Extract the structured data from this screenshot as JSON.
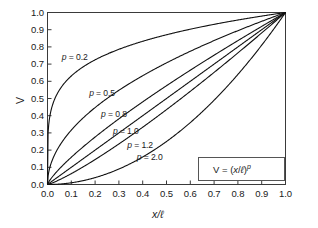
{
  "chart_data": {
    "type": "line",
    "title": "",
    "xlabel": "x/ℓ",
    "ylabel": "V",
    "xlim": [
      0.0,
      1.0
    ],
    "ylim": [
      0.0,
      1.0
    ],
    "grid": false,
    "legend_position": "inline-annotations",
    "equation": "V = (x/ℓ)ᵖ",
    "equation_parts": {
      "lhs": "V",
      "eq": "=",
      "open": "(",
      "num": "x",
      "slash": "/",
      "den": "ℓ",
      "close": ")",
      "exponent": "p"
    },
    "xticks": [
      "0.0",
      "0.1",
      "0.2",
      "0.3",
      "0.4",
      "0.5",
      "0.6",
      "0.7",
      "0.8",
      "0.9",
      "1.0"
    ],
    "xtick_values": [
      0.0,
      0.1,
      0.2,
      0.3,
      0.4,
      0.5,
      0.6,
      0.7,
      0.8,
      0.9,
      1.0
    ],
    "yticks": [
      "0.0",
      "0.1",
      "0.2",
      "0.3",
      "0.4",
      "0.5",
      "0.6",
      "0.7",
      "0.8",
      "0.9",
      "1.0"
    ],
    "ytick_values": [
      0.0,
      0.1,
      0.2,
      0.3,
      0.4,
      0.5,
      0.6,
      0.7,
      0.8,
      0.9,
      1.0
    ],
    "series": [
      {
        "name": "p = 0.2",
        "p": 0.2,
        "label": "p = 0.2",
        "x": [
          0.0,
          0.005,
          0.01,
          0.02,
          0.03,
          0.05,
          0.08,
          0.1,
          0.15,
          0.2,
          0.25,
          0.3,
          0.35,
          0.4,
          0.45,
          0.5,
          0.55,
          0.6,
          0.65,
          0.7,
          0.75,
          0.8,
          0.85,
          0.9,
          0.95,
          1.0
        ],
        "y": [
          0.0,
          0.346,
          0.398,
          0.457,
          0.495,
          0.549,
          0.605,
          0.631,
          0.684,
          0.725,
          0.758,
          0.786,
          0.81,
          0.833,
          0.852,
          0.871,
          0.887,
          0.903,
          0.917,
          0.931,
          0.944,
          0.956,
          0.968,
          0.979,
          0.99,
          1.0
        ]
      },
      {
        "name": "p = 0.5",
        "p": 0.5,
        "label": "p = 0.5",
        "x": [
          0.0,
          0.01,
          0.02,
          0.05,
          0.1,
          0.15,
          0.2,
          0.25,
          0.3,
          0.35,
          0.4,
          0.45,
          0.5,
          0.55,
          0.6,
          0.65,
          0.7,
          0.75,
          0.8,
          0.85,
          0.9,
          0.95,
          1.0
        ],
        "y": [
          0.0,
          0.1,
          0.141,
          0.224,
          0.316,
          0.387,
          0.447,
          0.5,
          0.548,
          0.592,
          0.632,
          0.671,
          0.707,
          0.742,
          0.775,
          0.806,
          0.837,
          0.866,
          0.894,
          0.922,
          0.949,
          0.975,
          1.0
        ]
      },
      {
        "name": "p = 0.8",
        "p": 0.8,
        "label": "p = 0.8",
        "x": [
          0.0,
          0.01,
          0.02,
          0.05,
          0.1,
          0.15,
          0.2,
          0.25,
          0.3,
          0.35,
          0.4,
          0.45,
          0.5,
          0.55,
          0.6,
          0.65,
          0.7,
          0.75,
          0.8,
          0.85,
          0.9,
          0.95,
          1.0
        ],
        "y": [
          0.0,
          0.025,
          0.044,
          0.095,
          0.158,
          0.219,
          0.275,
          0.33,
          0.382,
          0.433,
          0.48,
          0.528,
          0.574,
          0.618,
          0.663,
          0.706,
          0.748,
          0.79,
          0.831,
          0.871,
          0.911,
          0.951,
          1.0
        ]
      },
      {
        "name": "p = 1.0",
        "p": 1.0,
        "label": "p = 1.0",
        "x": [
          0.0,
          0.1,
          0.2,
          0.3,
          0.4,
          0.5,
          0.6,
          0.7,
          0.8,
          0.9,
          1.0
        ],
        "y": [
          0.0,
          0.1,
          0.2,
          0.3,
          0.4,
          0.5,
          0.6,
          0.7,
          0.8,
          0.9,
          1.0
        ]
      },
      {
        "name": "p = 1.2",
        "p": 1.2,
        "label": "p = 1.2",
        "x": [
          0.0,
          0.05,
          0.1,
          0.15,
          0.2,
          0.25,
          0.3,
          0.35,
          0.4,
          0.45,
          0.5,
          0.55,
          0.6,
          0.65,
          0.7,
          0.75,
          0.8,
          0.85,
          0.9,
          0.95,
          1.0
        ],
        "y": [
          0.0,
          0.0275,
          0.0631,
          0.1024,
          0.145,
          0.1895,
          0.2362,
          0.2845,
          0.334,
          0.3853,
          0.4373,
          0.4907,
          0.545,
          0.6004,
          0.6567,
          0.714,
          0.7719,
          0.8309,
          0.8905,
          0.9509,
          1.0
        ]
      },
      {
        "name": "p = 2.0",
        "p": 2.0,
        "label": "p = 2.0",
        "x": [
          0.0,
          0.05,
          0.1,
          0.15,
          0.2,
          0.25,
          0.3,
          0.35,
          0.4,
          0.45,
          0.5,
          0.55,
          0.6,
          0.65,
          0.7,
          0.75,
          0.8,
          0.85,
          0.9,
          0.95,
          1.0
        ],
        "y": [
          0.0,
          0.0025,
          0.01,
          0.0225,
          0.04,
          0.0625,
          0.09,
          0.1225,
          0.16,
          0.2025,
          0.25,
          0.3025,
          0.36,
          0.4225,
          0.49,
          0.5625,
          0.64,
          0.7225,
          0.81,
          0.9025,
          1.0
        ]
      }
    ],
    "annotations": [
      {
        "text": "p = 0.2",
        "x": 0.06,
        "y": 0.735
      },
      {
        "text": "p = 0.5",
        "x": 0.175,
        "y": 0.525
      },
      {
        "text": "p = 0.8",
        "x": 0.225,
        "y": 0.405
      },
      {
        "text": "p = 1.0",
        "x": 0.275,
        "y": 0.305
      },
      {
        "text": "p = 1.2",
        "x": 0.335,
        "y": 0.225
      },
      {
        "text": "p = 2.0",
        "x": 0.375,
        "y": 0.155
      }
    ],
    "colors": {
      "curve": "#111111",
      "axis": "#3a3a3a",
      "text": "#1a1a1a",
      "background": "#ffffff",
      "legend_border": "#555555"
    }
  }
}
